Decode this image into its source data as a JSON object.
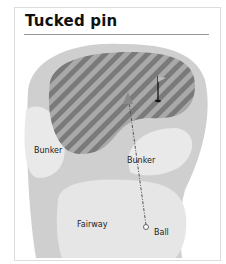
{
  "title": "Tucked pin",
  "labels": {
    "bunker_left": "Bunker",
    "bunker_right": "Bunker",
    "fairway": "Fairway",
    "ball": "Ball"
  },
  "colors": {
    "rough": "#cfcfcf",
    "bunker": "#e9e9e9",
    "fairway": "#e6e6e6",
    "green_stripe_dark": "#7a7a7a",
    "green_stripe_light": "#a9a9a9"
  }
}
